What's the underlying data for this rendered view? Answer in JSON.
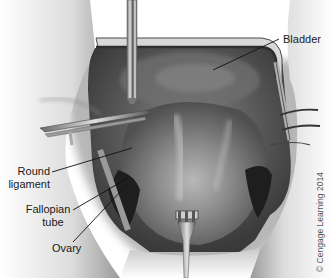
{
  "figure": {
    "labels": {
      "bladder": "Bladder",
      "round_ligament_line1": "Round",
      "round_ligament_line2": "ligament",
      "fallopian_tube_line1": "Fallopian",
      "fallopian_tube_line2": "tube",
      "ovary": "Ovary"
    },
    "copyright": "© Cengage Learning 2014"
  }
}
